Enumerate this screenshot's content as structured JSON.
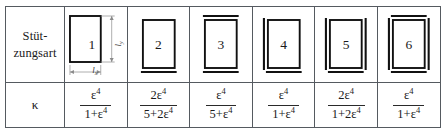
{
  "table": {
    "rows": {
      "diagram_label": {
        "line1": "Stüt-",
        "line2": "zungsart"
      },
      "kappa_label": "κ"
    },
    "cases": [
      {
        "number": "1",
        "clamped_edges": [],
        "kappa": {
          "numerator": "ε",
          "numerator_exp": "4",
          "numerator_coef": "",
          "denominator_pre": "1+",
          "denominator_base": "ε",
          "denominator_exp": "4",
          "denominator_coef": ""
        },
        "dimensions": {
          "horizontal": "l",
          "horizontal_sub": "x",
          "vertical": "l",
          "vertical_sub": "y"
        }
      },
      {
        "number": "2",
        "clamped_edges": [
          "bottom"
        ],
        "kappa": {
          "numerator": "ε",
          "numerator_exp": "4",
          "numerator_coef": "2",
          "denominator_pre": "5+",
          "denominator_base": "ε",
          "denominator_exp": "4",
          "denominator_coef": "2"
        }
      },
      {
        "number": "3",
        "clamped_edges": [
          "top",
          "bottom"
        ],
        "kappa": {
          "numerator": "ε",
          "numerator_exp": "4",
          "numerator_coef": "",
          "denominator_pre": "5+",
          "denominator_base": "ε",
          "denominator_exp": "4",
          "denominator_coef": ""
        }
      },
      {
        "number": "4",
        "clamped_edges": [
          "left",
          "bottom"
        ],
        "kappa": {
          "numerator": "ε",
          "numerator_exp": "4",
          "numerator_coef": "",
          "denominator_pre": "1+",
          "denominator_base": "ε",
          "denominator_exp": "4",
          "denominator_coef": ""
        }
      },
      {
        "number": "5",
        "clamped_edges": [
          "left",
          "right",
          "bottom"
        ],
        "kappa": {
          "numerator": "ε",
          "numerator_exp": "4",
          "numerator_coef": "2",
          "denominator_pre": "1+",
          "denominator_base": "ε",
          "denominator_exp": "4",
          "denominator_coef": "2"
        }
      },
      {
        "number": "6",
        "clamped_edges": [
          "top",
          "right",
          "bottom",
          "left"
        ],
        "kappa": {
          "numerator": "ε",
          "numerator_exp": "4",
          "numerator_coef": "",
          "denominator_pre": "1+",
          "denominator_base": "ε",
          "denominator_exp": "4",
          "denominator_coef": ""
        }
      }
    ]
  },
  "colors": {
    "border": "#555a60",
    "plate_stroke": "#111111",
    "dimension_stroke": "#777777",
    "text": "#1a1a1a"
  }
}
